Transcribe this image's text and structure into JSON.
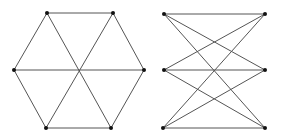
{
  "figure": {
    "width": 281,
    "height": 137,
    "background": "#ffffff",
    "edge_color": "#555555",
    "node_color": "#111111",
    "node_radius": 2
  },
  "graphs": [
    {
      "name": "hexagon-with-diagonals",
      "nodes": [
        {
          "id": "a",
          "x": 47,
          "y": 13
        },
        {
          "id": "b",
          "x": 113,
          "y": 13
        },
        {
          "id": "c",
          "x": 144,
          "y": 70
        },
        {
          "id": "d",
          "x": 111,
          "y": 128
        },
        {
          "id": "e",
          "x": 46,
          "y": 128
        },
        {
          "id": "f",
          "x": 14,
          "y": 70
        }
      ],
      "edges": [
        [
          "a",
          "b"
        ],
        [
          "b",
          "c"
        ],
        [
          "c",
          "d"
        ],
        [
          "d",
          "e"
        ],
        [
          "e",
          "f"
        ],
        [
          "f",
          "a"
        ],
        [
          "a",
          "d"
        ],
        [
          "b",
          "e"
        ],
        [
          "c",
          "f"
        ]
      ]
    },
    {
      "name": "complete-bipartite-k33",
      "nodes": [
        {
          "id": "l1",
          "x": 164,
          "y": 14
        },
        {
          "id": "l2",
          "x": 164,
          "y": 70
        },
        {
          "id": "l3",
          "x": 163,
          "y": 128
        },
        {
          "id": "r1",
          "x": 265,
          "y": 14
        },
        {
          "id": "r2",
          "x": 265,
          "y": 70
        },
        {
          "id": "r3",
          "x": 265,
          "y": 128
        }
      ],
      "edges": [
        [
          "l1",
          "r1"
        ],
        [
          "l1",
          "r2"
        ],
        [
          "l1",
          "r3"
        ],
        [
          "l2",
          "r1"
        ],
        [
          "l2",
          "r2"
        ],
        [
          "l2",
          "r3"
        ],
        [
          "l3",
          "r1"
        ],
        [
          "l3",
          "r2"
        ],
        [
          "l3",
          "r3"
        ]
      ]
    }
  ]
}
